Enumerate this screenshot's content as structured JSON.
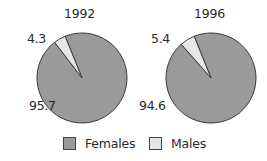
{
  "chart_data": [
    {
      "type": "pie",
      "title": "1992",
      "categories": [
        "Females",
        "Males"
      ],
      "values": [
        95.7,
        4.3
      ],
      "labels": [
        "95.7",
        "4.3"
      ],
      "colors": [
        "#9a9a9a",
        "#e6e6e6"
      ]
    },
    {
      "type": "pie",
      "title": "1996",
      "categories": [
        "Females",
        "Males"
      ],
      "values": [
        94.6,
        5.4
      ],
      "labels": [
        "94.6",
        "5.4"
      ],
      "colors": [
        "#9a9a9a",
        "#e6e6e6"
      ]
    }
  ],
  "legend": {
    "position": "bottom",
    "items": [
      {
        "label": "Females",
        "color": "#9a9a9a"
      },
      {
        "label": "Males",
        "color": "#e6e6e6"
      }
    ]
  },
  "style": {
    "stroke": "#3a3a3a"
  }
}
